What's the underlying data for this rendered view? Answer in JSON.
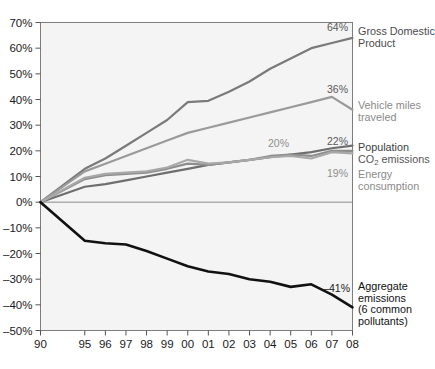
{
  "chart_data": {
    "type": "line",
    "title": "",
    "subtitle": "",
    "xlabel": "",
    "ylabel": "",
    "grid": false,
    "legend_position": "right-inline",
    "x": [
      "90",
      "95",
      "96",
      "97",
      "98",
      "99",
      "00",
      "01",
      "02",
      "03",
      "04",
      "05",
      "06",
      "07",
      "08"
    ],
    "xtick_labels": [
      "90",
      "95",
      "96",
      "97",
      "98",
      "99",
      "00",
      "01",
      "02",
      "03",
      "04",
      "05",
      "06",
      "07",
      "08"
    ],
    "ytick_labels": [
      "70%",
      "60%",
      "50%",
      "40%",
      "30%",
      "20%",
      "10%",
      "0%",
      "–10%",
      "–20%",
      "–30%",
      "–40%",
      "–50%"
    ],
    "ytick_values": [
      70,
      60,
      50,
      40,
      30,
      20,
      10,
      0,
      -10,
      -20,
      -30,
      -40,
      -50
    ],
    "ylim": [
      -50,
      70
    ],
    "series": [
      {
        "name": "Gross Domestic Product",
        "label": "Gross Domestic\nProduct",
        "label_line1": "Gross Domestic",
        "label_line2": "Product",
        "color": "#7a7a7a",
        "end_value_text": "64%",
        "end_value": 64,
        "values": [
          0,
          13,
          17,
          22,
          27,
          32,
          39,
          39.5,
          43,
          47,
          52,
          56,
          60,
          62,
          64
        ]
      },
      {
        "name": "Vehicle miles traveled",
        "label": "Vehicle miles\ntraveled",
        "label_line1": "Vehicle miles",
        "label_line2": "traveled",
        "color": "#9a9a9a",
        "end_value_text": "36%",
        "end_value": 36,
        "values": [
          0,
          12,
          15,
          18,
          21,
          24,
          27,
          29,
          31,
          33,
          35,
          37,
          39,
          41,
          36
        ]
      },
      {
        "name": "Population",
        "label": "Population",
        "label_line1": "Population",
        "label_line2": "",
        "color": "#6e6e6e",
        "end_value_text": "22%",
        "end_value": 22,
        "values": [
          0,
          6,
          7,
          8.5,
          10,
          11.5,
          13,
          14.5,
          15.5,
          16.5,
          17.5,
          18.5,
          19.5,
          21,
          22
        ]
      },
      {
        "name": "CO2 emissions",
        "label": "CO₂ emissions",
        "label_line1": "CO",
        "label_sub": "2",
        "label_line1_rest": " emissions",
        "color": "#8d8d8d",
        "end_value_text": "20%",
        "end_value": 20,
        "values": [
          0,
          9,
          10.5,
          11,
          11.5,
          13,
          15,
          14.5,
          15.5,
          16.5,
          18,
          18.5,
          18,
          20,
          20
        ]
      },
      {
        "name": "Energy consumption",
        "label": "Energy\nconsumption",
        "label_line1": "Energy",
        "label_line2": "consumption",
        "color": "#a8a8a8",
        "end_value_text": "19%",
        "end_value": 19,
        "values": [
          0,
          9.5,
          11,
          11.5,
          12,
          13.5,
          16.5,
          15,
          15.5,
          16.5,
          17.5,
          18,
          17,
          19.5,
          19
        ]
      },
      {
        "name": "Aggregate emissions (6 common pollutants)",
        "label": "Aggregate\nemissions\n(6 common\npollutants)",
        "label_line1": "Aggregate",
        "label_line2": "emissions",
        "label_line3": "(6 common",
        "label_line4": "pollutants)",
        "color": "#111111",
        "end_value_text": "–41%",
        "end_value": -41,
        "values": [
          0,
          -15,
          -16,
          -16.5,
          -19,
          -22,
          -25,
          -27,
          -28,
          -30,
          -31,
          -33,
          -32,
          -36,
          -41
        ]
      }
    ]
  }
}
